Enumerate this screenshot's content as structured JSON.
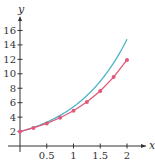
{
  "chart_data": {
    "type": "line",
    "title": "",
    "xlabel": "x",
    "ylabel": "y",
    "xlim": [
      0,
      2.4
    ],
    "ylim": [
      0,
      17
    ],
    "x_ticks": [
      0.5,
      1,
      1.5,
      2
    ],
    "x_tick_labels": [
      "0.5",
      "1",
      "1.5",
      "2"
    ],
    "y_ticks": [
      2,
      4,
      6,
      8,
      10,
      12,
      14,
      16
    ],
    "y_tick_labels": [
      "2",
      "4",
      "6",
      "8",
      "10",
      "12",
      "14",
      "16"
    ],
    "grid": false,
    "legend": null,
    "series": [
      {
        "name": "exact",
        "color": "#4fb3c8",
        "style": "smooth-line",
        "x": [
          0,
          0.25,
          0.5,
          0.75,
          1,
          1.25,
          1.5,
          1.75,
          2
        ],
        "values": [
          2,
          2.57,
          3.3,
          4.23,
          5.44,
          6.98,
          8.96,
          11.51,
          14.78
        ]
      },
      {
        "name": "approximation",
        "color": "#e0587a",
        "style": "line-with-markers",
        "x": [
          0,
          0.25,
          0.5,
          0.75,
          1,
          1.25,
          1.5,
          1.75,
          2
        ],
        "values": [
          2,
          2.5,
          3.13,
          3.91,
          4.88,
          6.1,
          7.63,
          9.54,
          11.92
        ]
      }
    ]
  }
}
